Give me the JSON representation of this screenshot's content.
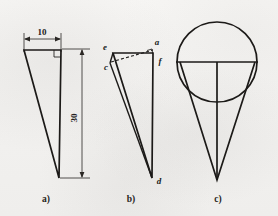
{
  "figure": {
    "background_color": "#f4f3f1",
    "ink_color": "#1c1a18",
    "captions": [
      {
        "key": "a",
        "label": "a)",
        "x": 46,
        "y": 201
      },
      {
        "key": "b",
        "label": "b)",
        "x": 131,
        "y": 201
      },
      {
        "key": "c",
        "label": "c)",
        "x": 218,
        "y": 201
      }
    ],
    "panels": [
      {
        "key": "a",
        "caption": "a)",
        "description": "Right triangle with width and height dimensions",
        "shape": "right-triangle",
        "dimensions": [
          {
            "name": "width-dimension",
            "value": "10",
            "orientation": "horizontal",
            "label_x": 41,
            "label_y": 35,
            "line_y": 39,
            "x_start": 24,
            "x_end": 61
          },
          {
            "name": "height-dimension",
            "value": "30",
            "orientation": "vertical",
            "label_x": 79,
            "label_y": 120,
            "line_x": 82,
            "y_start": 49,
            "y_end": 178
          }
        ],
        "right_angle_mark": true,
        "vertices": [
          {
            "name": "top-left",
            "x": 24,
            "y": 49
          },
          {
            "name": "top-right",
            "x": 61,
            "y": 49
          },
          {
            "name": "bottom",
            "x": 59,
            "y": 178
          }
        ]
      },
      {
        "key": "b",
        "caption": "b)",
        "description": "Triangle with labelled vertices and dashed construction line",
        "shape": "triangle-with-construction",
        "vertex_labels": [
          {
            "name": "vertex-e",
            "text": "e",
            "x": 106,
            "y": 48
          },
          {
            "name": "vertex-c",
            "text": "c",
            "x": 108,
            "y": 67
          },
          {
            "name": "vertex-a",
            "text": "a",
            "x": 156,
            "y": 45
          },
          {
            "name": "vertex-f",
            "text": "f",
            "x": 161,
            "y": 61
          },
          {
            "name": "vertex-d",
            "text": "d",
            "x": 157,
            "y": 182
          }
        ],
        "vertices": [
          {
            "name": "top-left-e",
            "x": 113,
            "y": 53
          },
          {
            "name": "top-right-f",
            "x": 153,
            "y": 53
          },
          {
            "name": "bottom-d",
            "x": 152,
            "y": 178
          },
          {
            "name": "offset-c",
            "x": 110,
            "y": 62
          },
          {
            "name": "offset-a",
            "x": 153,
            "y": 49
          }
        ],
        "has_dashed_line": true,
        "right_angle_mark": true
      },
      {
        "key": "c",
        "caption": "c)",
        "description": "Cone with inscribed circle, horizontal diameter and vertical axis",
        "shape": "cone-with-inscribed-circle",
        "circle": {
          "cx": 217,
          "cy": 62,
          "r": 40
        },
        "cone": {
          "apex_x": 217,
          "apex_y": 180,
          "left_x": 178,
          "right_x": 256,
          "top_y": 62
        },
        "horizontal_line": {
          "x_start": 176,
          "x_end": 258,
          "y": 62
        },
        "vertical_line": {
          "x": 217,
          "y_start": 62,
          "y_end": 180
        }
      }
    ]
  }
}
